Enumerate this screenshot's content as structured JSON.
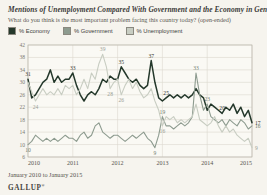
{
  "page": {
    "title": "Mentions of Unemployment Compared With Government and the Economy in General",
    "subtitle": "What do you think is the most important problem facing this country today? (open-ended)",
    "footer": "January 2010 to January 2015",
    "brand": "GALLUP",
    "brand_mark": "®",
    "background": "#f6f4ee"
  },
  "legend": [
    {
      "label": "% Economy",
      "color": "#24382b"
    },
    {
      "label": "% Government",
      "color": "#8d9b8f"
    },
    {
      "label": "% Unemployment",
      "color": "#c8cdc2"
    }
  ],
  "chart_data": {
    "type": "line",
    "title": "Mentions of Unemployment Compared With Government and the Economy in General",
    "subtitle": "What do you think is the most important problem facing this country today? (open-ended)",
    "x_unit": "month",
    "x_range": "January 2010 to January 2015",
    "x_tick_labels": [
      "2010",
      "2011",
      "2012",
      "2013",
      "2014",
      "2015"
    ],
    "y_ticks": [
      42,
      38,
      34,
      30,
      26,
      22,
      18,
      14,
      10,
      6
    ],
    "ylim": [
      6,
      42
    ],
    "grid": true,
    "legend_position": "top",
    "series": [
      {
        "name": "% Economy",
        "color": "#24382b",
        "label_color": "#35342f",
        "stroke_width": 1.5,
        "values": [
          31,
          25,
          26,
          28,
          30,
          31,
          34,
          30,
          32,
          30,
          31,
          31,
          33,
          29,
          26,
          24,
          26,
          27,
          26,
          28,
          31,
          30,
          32,
          31,
          31,
          35,
          33,
          31,
          30,
          31,
          29,
          28,
          29,
          37,
          30,
          25,
          24,
          25,
          26,
          25,
          26,
          25,
          26,
          25,
          26,
          28,
          26,
          25,
          21,
          23,
          22,
          21,
          20,
          22,
          21,
          23,
          20,
          22,
          19,
          21,
          17
        ]
      },
      {
        "name": "% Government",
        "color": "#8d9b8f",
        "label_color": "#6e7c70",
        "stroke_width": 1.1,
        "values": [
          10,
          11,
          13,
          12,
          11,
          12,
          11,
          12,
          11,
          12,
          13,
          12,
          12,
          11,
          13,
          14,
          12,
          13,
          16,
          17,
          14,
          13,
          12,
          13,
          13,
          12,
          11,
          12,
          13,
          12,
          13,
          14,
          12,
          11,
          9,
          13,
          19,
          16,
          16,
          15,
          16,
          17,
          16,
          17,
          19,
          33,
          26,
          21,
          23,
          19,
          18,
          17,
          18,
          16,
          18,
          17,
          16,
          18,
          17,
          15,
          16
        ]
      },
      {
        "name": "% Unemployment",
        "color": "#c8cdc2",
        "label_color": "#9aa094",
        "stroke_width": 1.1,
        "values": [
          30,
          27,
          24,
          26,
          28,
          26,
          27,
          26,
          28,
          26,
          29,
          28,
          29,
          26,
          28,
          31,
          28,
          33,
          31,
          36,
          39,
          35,
          28,
          30,
          31,
          26,
          29,
          31,
          28,
          30,
          27,
          25,
          26,
          28,
          24,
          21,
          16,
          19,
          18,
          19,
          17,
          18,
          17,
          18,
          19,
          23,
          18,
          17,
          16,
          17,
          19,
          16,
          14,
          16,
          14,
          15,
          13,
          12,
          11,
          12,
          9
        ]
      }
    ],
    "annotations": [
      {
        "series": 0,
        "month": 0,
        "value": 31,
        "pos": "above"
      },
      {
        "series": 0,
        "month": 12,
        "value": 33,
        "pos": "above"
      },
      {
        "series": 0,
        "month": 25,
        "value": 35,
        "pos": "above"
      },
      {
        "series": 0,
        "month": 33,
        "value": 37,
        "pos": "above"
      },
      {
        "series": 0,
        "month": 37,
        "value": 25,
        "pos": "above"
      },
      {
        "series": 0,
        "month": 52,
        "value": 20,
        "pos": "above"
      },
      {
        "series": 0,
        "month": 60,
        "value": 17,
        "pos": "right"
      },
      {
        "series": 1,
        "month": 0,
        "value": 10,
        "pos": "below"
      },
      {
        "series": 1,
        "month": 34,
        "value": 9,
        "pos": "below"
      },
      {
        "series": 1,
        "month": 36,
        "value": 19,
        "pos": "above"
      },
      {
        "series": 1,
        "month": 45,
        "value": 33,
        "pos": "above"
      },
      {
        "series": 1,
        "month": 48,
        "value": 23,
        "pos": "above"
      },
      {
        "series": 1,
        "month": 60,
        "value": 16,
        "pos": "right"
      },
      {
        "series": 2,
        "month": 2,
        "value": 24,
        "pos": "below"
      },
      {
        "series": 2,
        "month": 20,
        "value": 39,
        "pos": "above"
      },
      {
        "series": 2,
        "month": 22,
        "value": 28,
        "pos": "below"
      },
      {
        "series": 2,
        "month": 25,
        "value": 26,
        "pos": "below"
      },
      {
        "series": 2,
        "month": 36,
        "value": 16,
        "pos": "below"
      },
      {
        "series": 2,
        "month": 60,
        "value": 9,
        "pos": "right"
      }
    ]
  }
}
